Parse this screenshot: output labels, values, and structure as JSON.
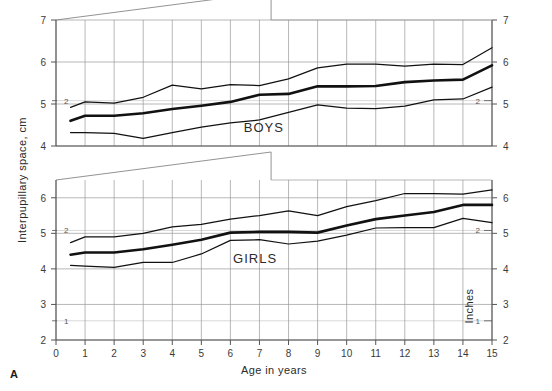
{
  "figure": {
    "letter": "A",
    "xlabel": "Age in years",
    "ylabel_left": "Interpupillary space, cm",
    "ylabel_right": "Inches"
  },
  "chart_data": {
    "type": "line",
    "title": "",
    "xlabel": "Age in years",
    "ylabel": "Interpupillary space, cm",
    "ylabel_secondary": "Inches",
    "grid": true,
    "legend": "inline-annotation",
    "panels": [
      {
        "name": "BOYS",
        "label": "BOYS",
        "xlim": [
          0,
          15
        ],
        "ylim": [
          4,
          7
        ],
        "yticks_cm": [
          4,
          5,
          6,
          7
        ],
        "yticks_inches": [
          2
        ],
        "ylim_inches_marks": {
          "2": 5.08
        },
        "x": [
          0.5,
          1,
          2,
          3,
          4,
          5,
          6,
          7,
          8,
          9,
          10,
          11,
          12,
          13,
          14,
          15
        ],
        "series": [
          {
            "name": "upper",
            "role": "upper-percentile",
            "values": [
              4.92,
              5.05,
              5.02,
              5.16,
              5.45,
              5.36,
              5.46,
              5.44,
              5.6,
              5.86,
              5.95,
              5.95,
              5.9,
              5.95,
              5.94,
              6.34
            ]
          },
          {
            "name": "mean",
            "role": "mean",
            "values": [
              4.6,
              4.72,
              4.72,
              4.78,
              4.88,
              4.96,
              5.05,
              5.22,
              5.24,
              5.42,
              5.42,
              5.43,
              5.52,
              5.56,
              5.58,
              5.92
            ]
          },
          {
            "name": "lower",
            "role": "lower-percentile",
            "values": [
              4.32,
              4.32,
              4.3,
              4.18,
              4.32,
              4.45,
              4.55,
              4.62,
              4.8,
              4.98,
              4.9,
              4.89,
              4.95,
              5.1,
              5.12,
              5.4
            ]
          }
        ]
      },
      {
        "name": "GIRLS",
        "label": "GIRLS",
        "xlim": [
          0,
          15
        ],
        "ylim": [
          2,
          6.5
        ],
        "yticks_cm": [
          2,
          3,
          4,
          5,
          6
        ],
        "yticks_inches": [
          1,
          2
        ],
        "ylim_inches_marks": {
          "1": 2.54,
          "2": 5.08
        },
        "x": [
          0.5,
          1,
          2,
          3,
          4,
          5,
          6,
          7,
          8,
          9,
          10,
          11,
          12,
          13,
          14,
          15
        ],
        "series": [
          {
            "name": "upper",
            "role": "upper-percentile",
            "values": [
              4.74,
              4.9,
              4.9,
              5.0,
              5.18,
              5.25,
              5.4,
              5.5,
              5.63,
              5.5,
              5.75,
              5.92,
              6.12,
              6.12,
              6.1,
              6.22
            ]
          },
          {
            "name": "mean",
            "role": "mean",
            "values": [
              4.4,
              4.46,
              4.46,
              4.55,
              4.68,
              4.82,
              5.02,
              5.04,
              5.04,
              5.02,
              5.22,
              5.4,
              5.5,
              5.6,
              5.8,
              5.8
            ]
          },
          {
            "name": "lower",
            "role": "lower-percentile",
            "values": [
              4.1,
              4.08,
              4.04,
              4.18,
              4.18,
              4.42,
              4.8,
              4.82,
              4.7,
              4.78,
              4.95,
              5.15,
              5.16,
              5.16,
              5.42,
              5.3
            ]
          }
        ]
      }
    ],
    "xticks": [
      "0",
      "1",
      "2",
      "3",
      "4",
      "5",
      "6",
      "7",
      "8",
      "9",
      "10",
      "11",
      "12",
      "13",
      "14",
      "15"
    ]
  },
  "colors": {
    "ink": "#231f20",
    "grid": "#9a9a9a",
    "frame": "#555555",
    "background": "#ffffff"
  }
}
